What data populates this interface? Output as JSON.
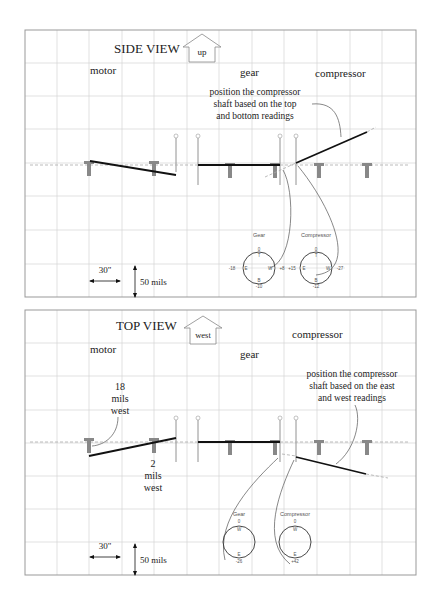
{
  "side_view": {
    "title": "SIDE VIEW",
    "direction_label": "up",
    "labels": {
      "motor": "motor",
      "gear": "gear",
      "compressor": "compressor"
    },
    "annotation": [
      "position the compressor",
      "shaft based on the top",
      "and bottom readings"
    ],
    "dials": {
      "gear": {
        "title": "Gear",
        "top": "0",
        "top_letter": "T",
        "left": "-18",
        "left_letter": "E",
        "right": "+8",
        "right_letter": "W",
        "bottom": "-10",
        "bottom_letter": "B"
      },
      "compressor": {
        "title": "Compressor",
        "top": "0",
        "top_letter": "T",
        "left": "+15",
        "left_letter": "E",
        "right": "-27",
        "right_letter": "W",
        "bottom": "-12",
        "bottom_letter": "B"
      }
    },
    "scale": {
      "horizontal": "30\"",
      "vertical": "50 mils"
    }
  },
  "top_view": {
    "title": "TOP VIEW",
    "direction_label": "west",
    "labels": {
      "motor": "motor",
      "gear": "gear",
      "compressor": "compressor"
    },
    "annotation": [
      "position the compressor",
      "shaft based on the east",
      "and west readings"
    ],
    "motor_note_1": [
      "18",
      "mils",
      "west"
    ],
    "motor_note_2": [
      "2",
      "mils",
      "west"
    ],
    "dials": {
      "gear": {
        "title": "Gear",
        "top": "0",
        "top_letter": "W",
        "bottom": "-26",
        "bottom_letter": "E"
      },
      "compressor": {
        "title": "Compressor",
        "top": "0",
        "top_letter": "W",
        "bottom": "+42",
        "bottom_letter": "E"
      }
    },
    "scale": {
      "horizontal": "30\"",
      "vertical": "50 mils"
    }
  }
}
